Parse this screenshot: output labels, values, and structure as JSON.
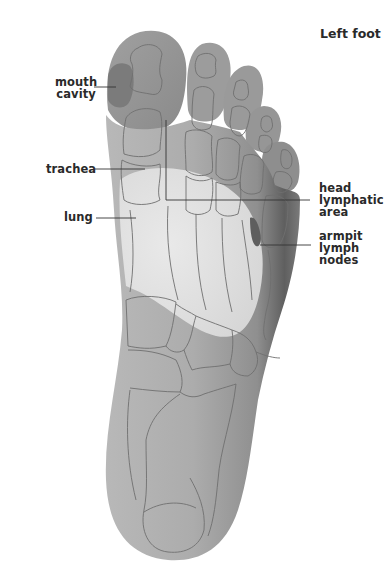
{
  "title": "Left foot",
  "labels": {
    "mouth_cavity": {
      "line1": "mouth",
      "line2": "cavity"
    },
    "trachea": {
      "line1": "trachea"
    },
    "lung": {
      "line1": "lung"
    },
    "head_lymphatic_area": {
      "line1": "head",
      "line2": "lymphatic",
      "line3": "area"
    },
    "armpit_lymph_nodes": {
      "line1": "armpit",
      "line2": "lymph",
      "line3": "nodes"
    }
  },
  "colors": {
    "background": "#ffffff",
    "foot_base": "#a9a9a9",
    "foot_shadow": "#6e6e6e",
    "lung_zone": "#e4e4e4",
    "mouth_zone": "#7a7a7a",
    "armpit_zone": "#6a6a6a",
    "bone_outline": "#6f6f6f",
    "leader_line": "#333333",
    "text": "#2a2a2a"
  }
}
